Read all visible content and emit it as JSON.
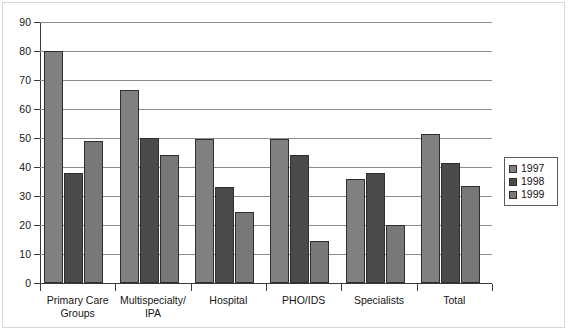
{
  "chart_data": {
    "type": "bar",
    "title": "",
    "xlabel": "",
    "ylabel": "",
    "ylim": [
      0,
      90
    ],
    "ytick_step": 10,
    "yticks": [
      "0",
      "10",
      "20",
      "30",
      "40",
      "50",
      "60",
      "70",
      "80",
      "90"
    ],
    "grid": true,
    "legend_position": "right",
    "categories": [
      "Primary Care Groups",
      "Multispecialty/ IPA",
      "Hospital",
      "PHO/IDS",
      "Specialists",
      "Total"
    ],
    "category_lines": [
      [
        "Primary Care",
        "Groups"
      ],
      [
        "Multispecialty/",
        "IPA"
      ],
      [
        "Hospital"
      ],
      [
        "PHO/IDS"
      ],
      [
        "Specialists"
      ],
      [
        "Total"
      ]
    ],
    "series": [
      {
        "name": "1997",
        "color": "#808080",
        "values": [
          80,
          66.5,
          49.5,
          49.5,
          36,
          51.5
        ]
      },
      {
        "name": "1998",
        "color": "#4a4a4a",
        "values": [
          38,
          50,
          33,
          44,
          38,
          41.5
        ]
      },
      {
        "name": "1999",
        "color": "#787878",
        "values": [
          49,
          44,
          24.5,
          14.5,
          20,
          33.5
        ]
      }
    ]
  },
  "legend": {
    "items": [
      {
        "label": "1997",
        "color": "#808080"
      },
      {
        "label": "1998",
        "color": "#4a4a4a"
      },
      {
        "label": "1999",
        "color": "#787878"
      }
    ]
  }
}
